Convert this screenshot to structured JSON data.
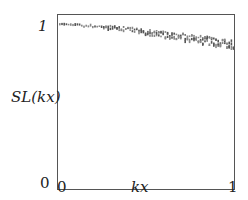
{
  "chart_data": {
    "type": "scatter",
    "title": "",
    "xlabel": "kx",
    "ylabel": "SL(kx)",
    "xlim": [
      0,
      1
    ],
    "ylim": [
      0,
      1
    ],
    "x_ticks": [
      "0",
      "1"
    ],
    "y_ticks": [
      "0",
      "1"
    ],
    "grid": false,
    "legend": null,
    "series": [
      {
        "name": "SL(kx)",
        "marker": "dense tiny text-like glyph markers",
        "x": [
          0.0,
          0.1,
          0.2,
          0.3,
          0.4,
          0.5,
          0.6,
          0.7,
          0.8,
          0.9,
          1.0
        ],
        "values": [
          0.995,
          0.99,
          0.985,
          0.975,
          0.965,
          0.95,
          0.935,
          0.92,
          0.905,
          0.89,
          0.875
        ]
      }
    ]
  },
  "axes": {
    "y_label": "SL(kx)",
    "x_label": "kx",
    "y_tick_top": "1",
    "y_tick_bottom": "0",
    "x_tick_left": "0",
    "x_tick_right": "1"
  }
}
